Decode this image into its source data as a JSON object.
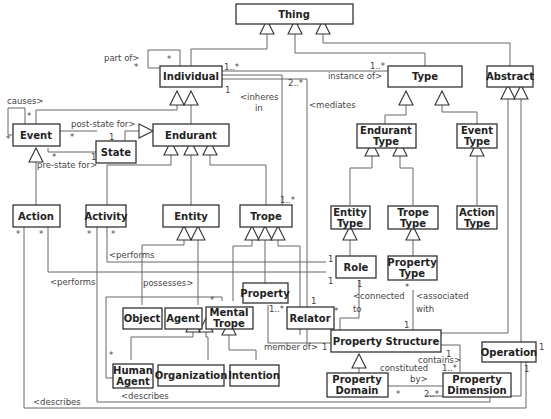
{
  "diagram": {
    "type": "UML class diagram",
    "classes": {
      "thing": "Thing",
      "individual": "Individual",
      "type": "Type",
      "abstract": "Abstract",
      "event": "Event",
      "state": "State",
      "endurant": "Endurant",
      "endurant_type_1": "Endurant",
      "endurant_type_2": "Type",
      "event_type_1": "Event",
      "event_type_2": "Type",
      "action": "Action",
      "activity": "Activity",
      "entity": "Entity",
      "trope": "Trope",
      "entity_type_1": "Entity",
      "entity_type_2": "Type",
      "trope_type_1": "Trope",
      "trope_type_2": "Type",
      "action_type_1": "Action",
      "action_type_2": "Type",
      "role": "Role",
      "property_type_1": "Property",
      "property_type_2": "Type",
      "property": "Property",
      "object": "Object",
      "agent": "Agent",
      "mental_trope_1": "Mental",
      "mental_trope_2": "Trope",
      "relator": "Relator",
      "property_structure": "Property Structure",
      "operation": "Operation",
      "human_agent_1": "Human",
      "human_agent_2": "Agent",
      "organization": "Organization",
      "intention": "Intention",
      "property_domain_1": "Property",
      "property_domain_2": "Domain",
      "property_dimension_1": "Property",
      "property_dimension_2": "Dimension"
    },
    "associations": {
      "part_of": "part of>",
      "instance_of": "instance of>",
      "inheres_in_1": "<inheres",
      "inheres_in_2": "in",
      "mediates": "<mediates",
      "causes": "causes>",
      "post_state_for": "post-state for>",
      "pre_state_for": "pre-state for>",
      "performs_activity": "<performs",
      "performs_action": "<performs",
      "possesses": "possesses>",
      "connected_to_1": "<connected",
      "connected_to_2": "to",
      "associated_with_1": "<associated",
      "associated_with_2": "with",
      "member_of": "member of>",
      "contains": "contains>",
      "constituted_by_1": "constituted",
      "constituted_by_2": "by>",
      "describes_action": "<describes",
      "describes_activity": "<describes"
    },
    "multiplicities": {
      "part_of_a": "*",
      "part_of_b": "*",
      "individual_instance": "1..*",
      "type_instance": "1..*",
      "individual_inheres": "1",
      "individual_mediates": "2..*",
      "trope_inheres": "1..*",
      "causes_a": "*",
      "causes_b": "*",
      "event_post": "*",
      "state_post": "1",
      "event_pre": "*",
      "state_pre": "1",
      "action_a": "*",
      "action_b": "*",
      "activity_a": "*",
      "activity_b": "*",
      "role_perf_1": "1",
      "role_perf_2": "1",
      "role_connected": "1",
      "relator_connected": "*",
      "relator_mediates": "1",
      "property_member": "1..*",
      "ps_member": "1",
      "ptype_assoc": "*",
      "ps_assoc": "1",
      "mental_possess": "*",
      "human_agent_star": "*",
      "ps_contains": "1",
      "pdim_contains": "1..*",
      "pdom_constituted": "*",
      "pdim_constituted": "2..*",
      "operation_a": "1",
      "operation_b": "1"
    }
  }
}
